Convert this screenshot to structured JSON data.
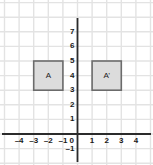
{
  "chart_data": {
    "type": "scatter",
    "title": "",
    "xlabel": "",
    "ylabel": "",
    "xlim": [
      -4.8,
      4.7
    ],
    "ylim": [
      -1.6,
      7.8
    ],
    "grid": true,
    "grid_spacing": 1,
    "legend": "none",
    "x_ticks": [
      -4,
      -3,
      -2,
      -1,
      1,
      2,
      3,
      4
    ],
    "x_tick_labels": [
      "–4",
      "–3",
      "–2",
      "–1",
      "1",
      "2",
      "3",
      "4"
    ],
    "y_ticks": [
      7,
      6,
      5,
      4,
      3,
      2,
      1,
      -1
    ],
    "y_tick_labels": [
      "7",
      "6",
      "5",
      "4",
      "3",
      "2",
      "1",
      "–1"
    ],
    "origin_label": "0",
    "shapes": [
      {
        "name": "A",
        "label": "A",
        "type": "square",
        "x_range": [
          -3,
          -1
        ],
        "y_range": [
          3,
          5
        ],
        "vertices": [
          [
            -3,
            5
          ],
          [
            -1,
            5
          ],
          [
            -1,
            3
          ],
          [
            -3,
            3
          ]
        ],
        "center": [
          -2,
          4
        ],
        "fill": "#dcdcdc",
        "stroke": "#6b6b6b"
      },
      {
        "name": "A-prime",
        "label": "A’",
        "type": "square",
        "x_range": [
          1,
          3
        ],
        "y_range": [
          3,
          5
        ],
        "vertices": [
          [
            1,
            5
          ],
          [
            3,
            5
          ],
          [
            3,
            3
          ],
          [
            1,
            3
          ]
        ],
        "center": [
          2,
          4
        ],
        "fill": "#dcdcdc",
        "stroke": "#6b6b6b"
      }
    ],
    "colors": {
      "background": "#ffffff",
      "grid": "#e3e3e3",
      "axis": "#2b2b2b",
      "shape_fill": "#dcdcdc",
      "shape_stroke": "#6b6b6b",
      "text": "#1a1a1a"
    }
  }
}
